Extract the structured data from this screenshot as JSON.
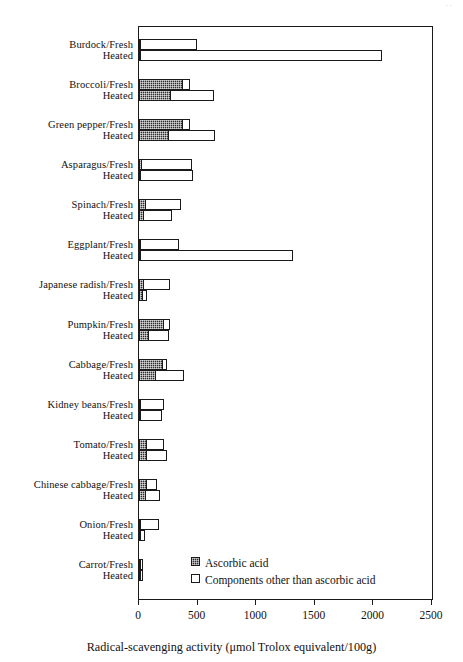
{
  "chart_data": {
    "type": "bar",
    "orientation": "horizontal",
    "stacked": true,
    "title": "",
    "xlabel": "Radical-scavenging activity (μmol Trolox equivalent/100g)",
    "ylabel": "",
    "xlim": [
      0,
      2500
    ],
    "xticks": [
      0,
      500,
      1000,
      1500,
      2000,
      2500
    ],
    "xtick_labels": [
      "0",
      "500",
      "1000",
      "1500",
      "2000",
      "2500"
    ],
    "grid": false,
    "legend_position": "inside-bottom-center",
    "series": [
      {
        "name": "Ascorbic acid",
        "style": "dark-hatched",
        "color": "#2b2b2b"
      },
      {
        "name": "Components other than ascorbic acid",
        "style": "white-outline",
        "color": "#ffffff"
      }
    ],
    "categories": [
      "Burdock/Fresh",
      "Heated",
      "Broccoli/Fresh",
      "Heated",
      "Green pepper/Fresh",
      "Heated",
      "Asparagus/Fresh",
      "Heated",
      "Spinach/Fresh",
      "Heated",
      "Eggplant/Fresh",
      "Heated",
      "Japanese radish/Fresh",
      "Heated",
      "Pumpkin/Fresh",
      "Heated",
      "Cabbage/Fresh",
      "Heated",
      "Kidney beans/Fresh",
      "Heated",
      "Tomato/Fresh",
      "Heated",
      "Chinese cabbage/Fresh",
      "Heated",
      "Onion/Fresh",
      "Heated",
      "Carrot/Fresh",
      "Heated"
    ],
    "groups": [
      {
        "vegetable": "Burdock",
        "rows": [
          {
            "label": "Burdock/Fresh",
            "state": "Fresh",
            "ascorbic_acid": 5,
            "other_components": 485,
            "total": 490
          },
          {
            "label": "Heated",
            "state": "Heated",
            "ascorbic_acid": 5,
            "other_components": 2065,
            "total": 2070
          }
        ]
      },
      {
        "vegetable": "Broccoli",
        "rows": [
          {
            "label": "Broccoli/Fresh",
            "state": "Fresh",
            "ascorbic_acid": 375,
            "other_components": 65,
            "total": 440
          },
          {
            "label": "Heated",
            "state": "Heated",
            "ascorbic_acid": 270,
            "other_components": 375,
            "total": 645
          }
        ]
      },
      {
        "vegetable": "Green pepper",
        "rows": [
          {
            "label": "Green pepper/Fresh",
            "state": "Fresh",
            "ascorbic_acid": 375,
            "other_components": 65,
            "total": 440
          },
          {
            "label": "Heated",
            "state": "Heated",
            "ascorbic_acid": 255,
            "other_components": 405,
            "total": 660
          }
        ]
      },
      {
        "vegetable": "Asparagus",
        "rows": [
          {
            "label": "Asparagus/Fresh",
            "state": "Fresh",
            "ascorbic_acid": 25,
            "other_components": 435,
            "total": 460
          },
          {
            "label": "Heated",
            "state": "Heated",
            "ascorbic_acid": 15,
            "other_components": 450,
            "total": 465
          }
        ]
      },
      {
        "vegetable": "Spinach",
        "rows": [
          {
            "label": "Spinach/Fresh",
            "state": "Fresh",
            "ascorbic_acid": 60,
            "other_components": 305,
            "total": 365
          },
          {
            "label": "Heated",
            "state": "Heated",
            "ascorbic_acid": 40,
            "other_components": 250,
            "total": 290
          }
        ]
      },
      {
        "vegetable": "Eggplant",
        "rows": [
          {
            "label": "Eggplant/Fresh",
            "state": "Fresh",
            "ascorbic_acid": 5,
            "other_components": 335,
            "total": 340
          },
          {
            "label": "Heated",
            "state": "Heated",
            "ascorbic_acid": 5,
            "other_components": 1305,
            "total": 1310
          }
        ]
      },
      {
        "vegetable": "Japanese radish",
        "rows": [
          {
            "label": "Japanese radish/Fresh",
            "state": "Fresh",
            "ascorbic_acid": 45,
            "other_components": 225,
            "total": 270
          },
          {
            "label": "Heated",
            "state": "Heated",
            "ascorbic_acid": 35,
            "other_components": 45,
            "total": 80
          }
        ]
      },
      {
        "vegetable": "Pumpkin",
        "rows": [
          {
            "label": "Pumpkin/Fresh",
            "state": "Fresh",
            "ascorbic_acid": 215,
            "other_components": 55,
            "total": 270
          },
          {
            "label": "Heated",
            "state": "Heated",
            "ascorbic_acid": 85,
            "other_components": 180,
            "total": 265
          }
        ]
      },
      {
        "vegetable": "Cabbage",
        "rows": [
          {
            "label": "Cabbage/Fresh",
            "state": "Fresh",
            "ascorbic_acid": 205,
            "other_components": 40,
            "total": 245
          },
          {
            "label": "Heated",
            "state": "Heated",
            "ascorbic_acid": 145,
            "other_components": 245,
            "total": 390
          }
        ]
      },
      {
        "vegetable": "Kidney beans",
        "rows": [
          {
            "label": "Kidney beans/Fresh",
            "state": "Fresh",
            "ascorbic_acid": 20,
            "other_components": 205,
            "total": 225
          },
          {
            "label": "Heated",
            "state": "Heated",
            "ascorbic_acid": 5,
            "other_components": 190,
            "total": 195
          }
        ]
      },
      {
        "vegetable": "Tomato",
        "rows": [
          {
            "label": "Tomato/Fresh",
            "state": "Fresh",
            "ascorbic_acid": 70,
            "other_components": 150,
            "total": 220
          },
          {
            "label": "Heated",
            "state": "Heated",
            "ascorbic_acid": 70,
            "other_components": 175,
            "total": 245
          }
        ]
      },
      {
        "vegetable": "Chinese cabbage",
        "rows": [
          {
            "label": "Chinese cabbage/Fresh",
            "state": "Fresh",
            "ascorbic_acid": 70,
            "other_components": 90,
            "total": 160
          },
          {
            "label": "Heated",
            "state": "Heated",
            "ascorbic_acid": 60,
            "other_components": 125,
            "total": 185
          }
        ]
      },
      {
        "vegetable": "Onion",
        "rows": [
          {
            "label": "Onion/Fresh",
            "state": "Fresh",
            "ascorbic_acid": 5,
            "other_components": 165,
            "total": 170
          },
          {
            "label": "Heated",
            "state": "Heated",
            "ascorbic_acid": 3,
            "other_components": 42,
            "total": 45
          }
        ]
      },
      {
        "vegetable": "Carrot",
        "rows": [
          {
            "label": "Carrot/Fresh",
            "state": "Fresh",
            "ascorbic_acid": 5,
            "other_components": 25,
            "total": 30
          },
          {
            "label": "Heated",
            "state": "Heated",
            "ascorbic_acid": 3,
            "other_components": 27,
            "total": 30
          }
        ]
      }
    ]
  },
  "legend": {
    "items": [
      {
        "label": "Ascorbic acid",
        "swatch": "dark-hatched"
      },
      {
        "label": "Components other than ascorbic acid",
        "swatch": "white-outline"
      }
    ]
  },
  "axis": {
    "x_title": "Radical-scavenging activity (μmol Trolox equivalent/100g)"
  }
}
